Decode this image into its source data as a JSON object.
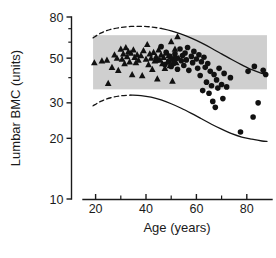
{
  "chart_data": {
    "type": "scatter",
    "title": "",
    "xlabel": "Age (years)",
    "ylabel": "Lumbar BMC (units)",
    "xlim": [
      15,
      90
    ],
    "ylim": [
      10,
      80
    ],
    "yscale": "log",
    "xscale": "linear",
    "grid": false,
    "legend": "none",
    "xticks_major": [
      20,
      40,
      60,
      80
    ],
    "xticks_minor": [
      30,
      50,
      70
    ],
    "xtick_labels": [
      "20",
      "40",
      "60",
      "80"
    ],
    "yticks_major": [
      10,
      20,
      30,
      50,
      80
    ],
    "yticks_minor": [
      40,
      60,
      70
    ],
    "ytick_labels": [
      "10",
      "20",
      "30",
      "50",
      "80"
    ],
    "reference_band": {
      "label": "normal reference range",
      "color": "#cfcfcf",
      "y_low": 35,
      "y_high": 65,
      "x_start": 19,
      "x_end": 88
    },
    "series": [
      {
        "name": "premenopausal",
        "marker": "triangle",
        "color": "#111111",
        "points": [
          [
            19.5,
            47.5
          ],
          [
            22.5,
            48.5
          ],
          [
            24.5,
            49.0
          ],
          [
            25.0,
            37.5
          ],
          [
            26.5,
            45.0
          ],
          [
            27.5,
            52.0
          ],
          [
            28.5,
            50.0
          ],
          [
            29.0,
            43.5
          ],
          [
            30.0,
            55.5
          ],
          [
            30.5,
            49.5
          ],
          [
            31.0,
            52.5
          ],
          [
            31.5,
            47.0
          ],
          [
            32.0,
            56.5
          ],
          [
            32.5,
            51.0
          ],
          [
            33.0,
            54.0
          ],
          [
            33.5,
            48.0
          ],
          [
            34.0,
            53.0
          ],
          [
            34.5,
            41.5
          ],
          [
            35.0,
            55.0
          ],
          [
            35.5,
            50.5
          ],
          [
            36.0,
            47.5
          ],
          [
            36.5,
            52.0
          ],
          [
            37.0,
            49.0
          ],
          [
            38.0,
            51.5
          ],
          [
            38.5,
            41.0
          ],
          [
            39.0,
            54.5
          ],
          [
            40.0,
            49.5
          ],
          [
            40.5,
            58.5
          ],
          [
            41.0,
            46.5
          ],
          [
            41.5,
            52.5
          ],
          [
            42.0,
            50.0
          ],
          [
            42.5,
            44.0
          ],
          [
            43.0,
            53.5
          ],
          [
            43.5,
            48.5
          ],
          [
            44.0,
            51.0
          ],
          [
            44.5,
            39.5
          ],
          [
            45.0,
            55.0
          ],
          [
            45.5,
            49.0
          ],
          [
            46.0,
            52.0
          ],
          [
            46.5,
            47.0
          ],
          [
            47.0,
            50.5
          ],
          [
            47.5,
            44.5
          ],
          [
            48.0,
            53.0
          ],
          [
            48.5,
            48.0
          ],
          [
            49.0,
            51.5
          ],
          [
            49.5,
            46.0
          ],
          [
            50.0,
            60.5
          ],
          [
            50.5,
            38.5
          ],
          [
            51.0,
            49.5
          ],
          [
            51.5,
            55.5
          ],
          [
            52.0,
            47.5
          ],
          [
            52.5,
            64.0
          ],
          [
            53.0,
            50.0
          ]
        ]
      },
      {
        "name": "postmenopausal",
        "marker": "circle",
        "color": "#111111",
        "points": [
          [
            44.5,
            49.0
          ],
          [
            46.0,
            57.0
          ],
          [
            47.5,
            46.5
          ],
          [
            48.0,
            53.5
          ],
          [
            49.0,
            48.0
          ],
          [
            49.5,
            51.0
          ],
          [
            50.0,
            45.5
          ],
          [
            50.5,
            49.5
          ],
          [
            51.0,
            47.0
          ],
          [
            51.5,
            52.5
          ],
          [
            52.0,
            50.0
          ],
          [
            52.5,
            44.0
          ],
          [
            53.5,
            55.5
          ],
          [
            54.0,
            48.5
          ],
          [
            54.5,
            51.5
          ],
          [
            55.0,
            46.0
          ],
          [
            55.5,
            53.0
          ],
          [
            56.0,
            49.0
          ],
          [
            56.5,
            56.5
          ],
          [
            57.0,
            43.5
          ],
          [
            58.0,
            51.0
          ],
          [
            58.5,
            47.5
          ],
          [
            59.0,
            54.0
          ],
          [
            60.0,
            49.5
          ],
          [
            60.5,
            44.5
          ],
          [
            61.0,
            52.0
          ],
          [
            61.5,
            41.0
          ],
          [
            62.0,
            48.0
          ],
          [
            62.5,
            34.5
          ],
          [
            63.0,
            50.5
          ],
          [
            63.5,
            45.0
          ],
          [
            64.0,
            38.0
          ],
          [
            64.5,
            47.0
          ],
          [
            65.0,
            33.5
          ],
          [
            65.5,
            43.0
          ],
          [
            66.0,
            36.5
          ],
          [
            66.5,
            30.5
          ],
          [
            67.0,
            41.5
          ],
          [
            67.5,
            28.5
          ],
          [
            68.0,
            39.0
          ],
          [
            68.5,
            35.5
          ],
          [
            69.0,
            44.5
          ],
          [
            70.0,
            37.0
          ],
          [
            70.5,
            31.5
          ],
          [
            71.0,
            42.0
          ],
          [
            72.0,
            36.0
          ],
          [
            73.5,
            40.0
          ],
          [
            77.5,
            21.5
          ],
          [
            80.5,
            43.0
          ],
          [
            82.5,
            25.5
          ],
          [
            83.0,
            45.5
          ],
          [
            84.5,
            30.0
          ],
          [
            86.5,
            43.5
          ],
          [
            87.5,
            41.5
          ]
        ]
      }
    ],
    "reference_curves": [
      {
        "name": "upper-limit",
        "style_solid_from_x": 47,
        "dashed_before": true,
        "points": [
          [
            19,
            63.0
          ],
          [
            22,
            66.5
          ],
          [
            26,
            69.5
          ],
          [
            30,
            71.0
          ],
          [
            34,
            71.8
          ],
          [
            38,
            71.9
          ],
          [
            42,
            71.4
          ],
          [
            46,
            70.2
          ],
          [
            50,
            68.3
          ],
          [
            54,
            65.8
          ],
          [
            58,
            62.8
          ],
          [
            62,
            59.5
          ],
          [
            66,
            56.0
          ],
          [
            70,
            52.5
          ],
          [
            74,
            49.2
          ],
          [
            78,
            46.3
          ],
          [
            82,
            43.8
          ],
          [
            86,
            42.0
          ],
          [
            88,
            41.3
          ]
        ]
      },
      {
        "name": "lower-limit",
        "style_solid_from_x": 36,
        "dashed_before": true,
        "points": [
          [
            19,
            29.0
          ],
          [
            22,
            30.5
          ],
          [
            26,
            31.8
          ],
          [
            30,
            32.5
          ],
          [
            34,
            32.8
          ],
          [
            38,
            32.6
          ],
          [
            42,
            32.0
          ],
          [
            46,
            31.0
          ],
          [
            50,
            29.7
          ],
          [
            54,
            28.2
          ],
          [
            58,
            26.6
          ],
          [
            62,
            25.0
          ],
          [
            66,
            23.5
          ],
          [
            70,
            22.2
          ],
          [
            74,
            21.1
          ],
          [
            78,
            20.3
          ],
          [
            82,
            19.8
          ],
          [
            86,
            19.4
          ],
          [
            88,
            19.3
          ]
        ]
      }
    ]
  },
  "axes": {
    "x_title": "Age (years)",
    "y_title": "Lumbar BMC (units)",
    "x_labels": [
      "20",
      "40",
      "60",
      "80"
    ],
    "y_labels": [
      "80",
      "50",
      "30",
      "20",
      "10"
    ]
  }
}
